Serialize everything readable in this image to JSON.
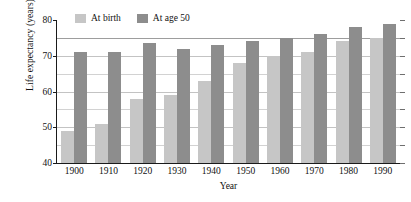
{
  "chart_data": {
    "type": "bar",
    "title": "",
    "xlabel": "Year",
    "ylabel": "Life expectancy (years)",
    "categories": [
      "1900",
      "1910",
      "1920",
      "1930",
      "1940",
      "1950",
      "1960",
      "1970",
      "1980",
      "1990"
    ],
    "series": [
      {
        "name": "At birth",
        "color": "#c6c6c6",
        "values": [
          49,
          51,
          58,
          59,
          63,
          68,
          70,
          71,
          74,
          75
        ]
      },
      {
        "name": "At age 50",
        "color": "#8d8d8d",
        "values": [
          71,
          71,
          73.5,
          72,
          73,
          74,
          75,
          76,
          78,
          79
        ]
      }
    ],
    "ylim": [
      40,
      80
    ],
    "yticks": [
      40,
      50,
      60,
      70,
      80
    ],
    "ytick_labels": [
      "40",
      "50",
      "60",
      "70",
      "80"
    ],
    "gridlines": [
      45,
      50,
      55,
      60,
      65,
      70,
      75
    ],
    "grid": true,
    "legend_position": "top-left-inside"
  },
  "legend": {
    "items": [
      {
        "label": "At birth"
      },
      {
        "label": "At age 50"
      }
    ]
  },
  "axes": {
    "y_title": "Life expectancy (years)",
    "x_title": "Year"
  }
}
